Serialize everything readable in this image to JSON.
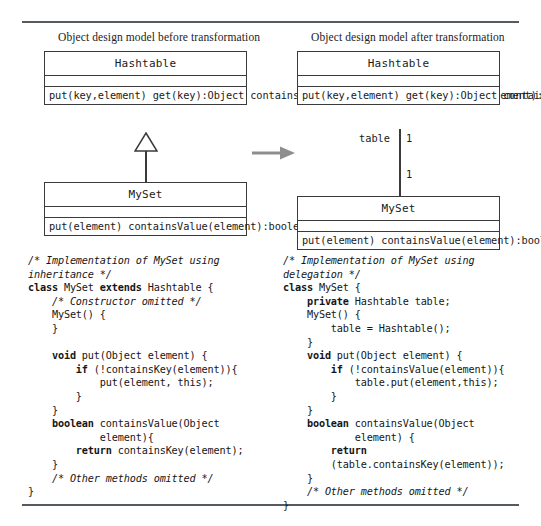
{
  "figure": {
    "captions": {
      "before": "Object design model before transformation",
      "after": "Object design model after transformation"
    },
    "transform_arrow_name": "transformation-arrow"
  },
  "diagram_before": {
    "classes": [
      {
        "name": "Hashtable",
        "attributes": "",
        "operations": "put(key,element)\nget(key):Object\ncontainsKey(key):boolean\ncontainsValue(element):boolean"
      },
      {
        "name": "MySet",
        "attributes": "",
        "operations": "put(element)\ncontainsValue(element):boolean"
      }
    ],
    "relationship": {
      "type": "generalization",
      "from": "MySet",
      "to": "Hashtable"
    }
  },
  "diagram_after": {
    "classes": [
      {
        "name": "Hashtable",
        "attributes": "",
        "operations": "put(key,element)\nget(key):Object\ncontainsKey(key):boolean\ncontainsValue(element):boolean"
      },
      {
        "name": "MySet",
        "attributes": "",
        "operations": "put(element)\ncontainsValue(element):boolean"
      }
    ],
    "relationship": {
      "type": "association",
      "role": "table",
      "multiplicity_top": "1",
      "multiplicity_bottom": "1"
    }
  },
  "code_before": {
    "lines": [
      {
        "text": "/* Implementation of MySet using",
        "style": "cmt"
      },
      {
        "text": "inheritance */",
        "style": "cmt"
      },
      {
        "segments": [
          {
            "t": "class ",
            "s": "kw"
          },
          {
            "t": "MySet "
          },
          {
            "t": "extends ",
            "s": "kw"
          },
          {
            "t": "Hashtable {"
          }
        ]
      },
      {
        "text": "    /* Constructor omitted */",
        "style": "cmt"
      },
      {
        "text": "    MySet() {"
      },
      {
        "text": "    }"
      },
      {
        "text": ""
      },
      {
        "segments": [
          {
            "t": "    void ",
            "s": "kw"
          },
          {
            "t": "put(Object element) {"
          }
        ]
      },
      {
        "segments": [
          {
            "t": "        if ",
            "s": "kw"
          },
          {
            "t": "(!containsKey(element)){"
          }
        ]
      },
      {
        "text": "            put(element, this);"
      },
      {
        "text": "        }"
      },
      {
        "text": "    }"
      },
      {
        "segments": [
          {
            "t": "    boolean ",
            "s": "kw"
          },
          {
            "t": "containsValue(Object"
          }
        ]
      },
      {
        "text": "            element){"
      },
      {
        "segments": [
          {
            "t": "        return ",
            "s": "kw"
          },
          {
            "t": "containsKey(element);"
          }
        ]
      },
      {
        "text": "    }"
      },
      {
        "text": "    /* Other methods omitted */",
        "style": "cmt"
      },
      {
        "text": "}"
      }
    ]
  },
  "code_after": {
    "lines": [
      {
        "text": "/* Implementation of MySet using",
        "style": "cmt"
      },
      {
        "text": "delegation */",
        "style": "cmt"
      },
      {
        "segments": [
          {
            "t": "class ",
            "s": "kw"
          },
          {
            "t": "MySet {"
          }
        ]
      },
      {
        "segments": [
          {
            "t": "    private ",
            "s": "kw"
          },
          {
            "t": "Hashtable table;"
          }
        ]
      },
      {
        "text": "    MySet() {"
      },
      {
        "text": "        table = Hashtable();"
      },
      {
        "text": "    }"
      },
      {
        "segments": [
          {
            "t": "    void ",
            "s": "kw"
          },
          {
            "t": "put(Object element) {"
          }
        ]
      },
      {
        "segments": [
          {
            "t": "        if ",
            "s": "kw"
          },
          {
            "t": "(!containsValue(element)){"
          }
        ]
      },
      {
        "text": "            table.put(element,this);"
      },
      {
        "text": "        }"
      },
      {
        "text": "    }"
      },
      {
        "segments": [
          {
            "t": "    boolean ",
            "s": "kw"
          },
          {
            "t": "containsValue(Object"
          }
        ]
      },
      {
        "text": "            element) {"
      },
      {
        "segments": [
          {
            "t": "        return",
            "s": "kw"
          }
        ]
      },
      {
        "text": "        (table.containsKey(element));"
      },
      {
        "text": "    }"
      },
      {
        "text": "    /* Other methods omitted */",
        "style": "cmt"
      },
      {
        "text": "}"
      }
    ]
  }
}
